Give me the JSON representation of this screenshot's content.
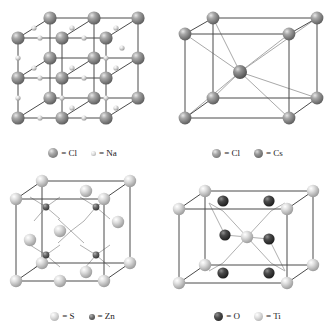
{
  "figure": {
    "background_color": "#ffffff",
    "panels": [
      {
        "id": "nacl",
        "structure_name": "rock-salt",
        "legend": [
          {
            "label": "= Cl",
            "element": "Cl",
            "sphere_color": "#8e8e8e",
            "sphere_size": 10
          },
          {
            "label": "= Na",
            "element": "Na",
            "sphere_color": "#d8d8d8",
            "sphere_size": 5
          }
        ]
      },
      {
        "id": "cscl",
        "structure_name": "cesium-chloride",
        "legend": [
          {
            "label": "= Cl",
            "element": "Cl",
            "sphere_color": "#8e8e8e",
            "sphere_size": 9
          },
          {
            "label": "= Cs",
            "element": "Cs",
            "sphere_color": "#808080",
            "sphere_size": 9
          }
        ]
      },
      {
        "id": "zns",
        "structure_name": "zinc-blende",
        "legend": [
          {
            "label": "= S",
            "element": "S",
            "sphere_color": "#d5d5d5",
            "sphere_size": 9
          },
          {
            "label": "= Zn",
            "element": "Zn",
            "sphere_color": "#6b6b6b",
            "sphere_size": 6
          }
        ]
      },
      {
        "id": "tio2",
        "structure_name": "rutile",
        "legend": [
          {
            "label": "= O",
            "element": "O",
            "sphere_color": "#3a3a3a",
            "sphere_size": 9
          },
          {
            "label": "= Ti",
            "element": "Ti",
            "sphere_color": "#d5d5d5",
            "sphere_size": 9
          }
        ]
      }
    ],
    "colors": {
      "bond_line": "#4a4a4a",
      "diagonal_line": "#a9a9a9",
      "sphere_large_gray": "#8e8e8e",
      "sphere_light": "#d5d5d5",
      "sphere_dark": "#3a3a3a",
      "text": "#1a1a1a"
    }
  }
}
